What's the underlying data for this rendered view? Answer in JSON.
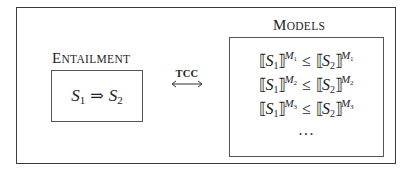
{
  "diagram": {
    "entailment": {
      "title_first": "E",
      "title_rest": "NTAILMENT",
      "formula": {
        "lhs_var": "S",
        "lhs_sub": "1",
        "operator": "⇒",
        "rhs_var": "S",
        "rhs_sub": "2"
      }
    },
    "connector": {
      "label": "TCC",
      "arrow": "bidirectional-arrow"
    },
    "models": {
      "title_first": "M",
      "title_rest": "ODELS",
      "rows": [
        {
          "open": "⟦",
          "lhs_var": "S",
          "lhs_sub": "1",
          "close": "⟧",
          "model": "M",
          "model_sub": "1",
          "op": "≤",
          "rhs_var": "S",
          "rhs_sub": "2"
        },
        {
          "open": "⟦",
          "lhs_var": "S",
          "lhs_sub": "1",
          "close": "⟧",
          "model": "M",
          "model_sub": "2",
          "op": "≤",
          "rhs_var": "S",
          "rhs_sub": "2"
        },
        {
          "open": "⟦",
          "lhs_var": "S",
          "lhs_sub": "1",
          "close": "⟧",
          "model": "M",
          "model_sub": "3",
          "op": "≤",
          "rhs_var": "S",
          "rhs_sub": "2"
        }
      ],
      "ellipsis": "···"
    },
    "colors": {
      "line": "#555555",
      "outer_line": "#3a3a3a",
      "text": "#1e1e1e"
    }
  }
}
